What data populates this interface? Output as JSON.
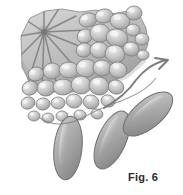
{
  "figure": {
    "caption": "Fig. 6",
    "title": "Fig. 6",
    "style": "grayscale line-and-tone scientific illustration",
    "background_color": "#ffffff",
    "palette": {
      "outline": "#6e6e6e",
      "outline_dark": "#555555",
      "matrix_light": "#d2d2d2",
      "matrix_mid": "#b4b4b4",
      "matrix_dark": "#8f8f8f",
      "cell_light": "#e6e6e6",
      "cell_mid": "#c3c3c3",
      "cell_shadow": "#9a9a9a",
      "appendage_light": "#cfcfcf",
      "appendage_mid": "#a9a9a9",
      "appendage_dark": "#868686",
      "ray_line": "#7a7a7a",
      "arrow": "#7b7b7b",
      "caption_text": "#2b2b2b"
    },
    "canvas": {
      "width": 183,
      "height": 195
    }
  },
  "elements": {
    "matrix_block_label": "shaded tissue matrix block",
    "radial_center": {
      "x": 44,
      "y": 32,
      "spokes": 12
    },
    "cell_cluster_label": "packed rounded cell cluster",
    "appendages_label": "elongated lobed appendages",
    "arrow_label": "curved directional arrow"
  },
  "cells": [
    {
      "cx": 88,
      "cy": 20,
      "rx": 9,
      "ry": 7,
      "rot": -14
    },
    {
      "cx": 104,
      "cy": 16,
      "rx": 9,
      "ry": 7,
      "rot": -10
    },
    {
      "cx": 120,
      "cy": 21,
      "rx": 10,
      "ry": 8,
      "rot": 8
    },
    {
      "cx": 134,
      "cy": 13,
      "rx": 8,
      "ry": 7,
      "rot": 0
    },
    {
      "cx": 85,
      "cy": 36,
      "rx": 8,
      "ry": 7,
      "rot": -20
    },
    {
      "cx": 100,
      "cy": 33,
      "rx": 10,
      "ry": 9,
      "rot": 6
    },
    {
      "cx": 117,
      "cy": 38,
      "rx": 11,
      "ry": 9,
      "rot": 14
    },
    {
      "cx": 133,
      "cy": 30,
      "rx": 7,
      "ry": 6,
      "rot": 0
    },
    {
      "cx": 142,
      "cy": 39,
      "rx": 7,
      "ry": 6,
      "rot": 0
    },
    {
      "cx": 84,
      "cy": 50,
      "rx": 8,
      "ry": 7,
      "rot": -14
    },
    {
      "cx": 99,
      "cy": 50,
      "rx": 9,
      "ry": 8,
      "rot": 4
    },
    {
      "cx": 115,
      "cy": 54,
      "rx": 10,
      "ry": 9,
      "rot": 18
    },
    {
      "cx": 131,
      "cy": 49,
      "rx": 8,
      "ry": 7,
      "rot": 10
    },
    {
      "cx": 143,
      "cy": 55,
      "rx": 6,
      "ry": 5,
      "rot": 0
    },
    {
      "cx": 36,
      "cy": 74,
      "rx": 8,
      "ry": 7,
      "rot": -18
    },
    {
      "cx": 52,
      "cy": 71,
      "rx": 9,
      "ry": 8,
      "rot": -8
    },
    {
      "cx": 69,
      "cy": 70,
      "rx": 10,
      "ry": 8,
      "rot": 2
    },
    {
      "cx": 86,
      "cy": 68,
      "rx": 10,
      "ry": 9,
      "rot": -4
    },
    {
      "cx": 102,
      "cy": 68,
      "rx": 9,
      "ry": 8,
      "rot": 8
    },
    {
      "cx": 118,
      "cy": 70,
      "rx": 9,
      "ry": 8,
      "rot": 16
    },
    {
      "cx": 30,
      "cy": 88,
      "rx": 8,
      "ry": 7,
      "rot": -24
    },
    {
      "cx": 46,
      "cy": 88,
      "rx": 9,
      "ry": 8,
      "rot": -10
    },
    {
      "cx": 63,
      "cy": 87,
      "rx": 10,
      "ry": 8,
      "rot": 0
    },
    {
      "cx": 81,
      "cy": 85,
      "rx": 10,
      "ry": 9,
      "rot": 6
    },
    {
      "cx": 99,
      "cy": 86,
      "rx": 10,
      "ry": 9,
      "rot": 12
    },
    {
      "cx": 116,
      "cy": 87,
      "rx": 8,
      "ry": 7,
      "rot": 20
    },
    {
      "cx": 28,
      "cy": 103,
      "rx": 7,
      "ry": 6,
      "rot": -20
    },
    {
      "cx": 43,
      "cy": 104,
      "rx": 7,
      "ry": 6,
      "rot": -6
    },
    {
      "cx": 58,
      "cy": 103,
      "rx": 7,
      "ry": 6,
      "rot": 0
    },
    {
      "cx": 74,
      "cy": 101,
      "rx": 8,
      "ry": 7,
      "rot": 6
    },
    {
      "cx": 91,
      "cy": 102,
      "rx": 8,
      "ry": 7,
      "rot": 14
    },
    {
      "cx": 108,
      "cy": 101,
      "rx": 7,
      "ry": 6,
      "rot": 18
    },
    {
      "cx": 34,
      "cy": 116,
      "rx": 6,
      "ry": 5,
      "rot": 0
    },
    {
      "cx": 48,
      "cy": 118,
      "rx": 6,
      "ry": 5,
      "rot": 0
    },
    {
      "cx": 62,
      "cy": 116,
      "rx": 6,
      "ry": 5,
      "rot": 0
    },
    {
      "cx": 80,
      "cy": 115,
      "rx": 6,
      "ry": 5,
      "rot": 8
    },
    {
      "cx": 97,
      "cy": 114,
      "rx": 6,
      "ry": 5,
      "rot": 12
    }
  ],
  "appendages": [
    {
      "cx": 68,
      "cy": 148,
      "rx": 14,
      "ry": 32,
      "rot": 6,
      "name": "appendage-left"
    },
    {
      "cx": 112,
      "cy": 140,
      "rx": 14,
      "ry": 31,
      "rot": 24,
      "name": "appendage-middle"
    },
    {
      "cx": 148,
      "cy": 114,
      "rx": 14,
      "ry": 30,
      "rot": 50,
      "name": "appendage-right"
    }
  ]
}
